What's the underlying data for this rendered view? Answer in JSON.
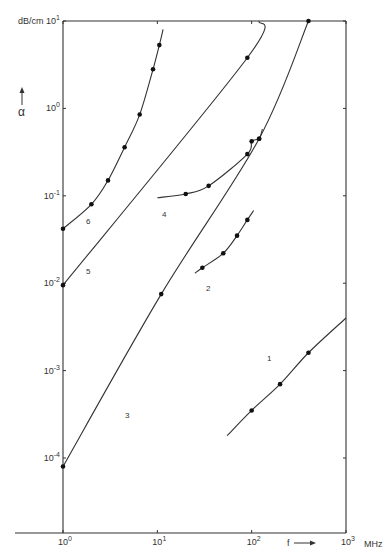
{
  "chart_data": {
    "type": "line",
    "title": "",
    "xlabel": "f",
    "xunit": "MHz",
    "ylabel": "α",
    "yunit": "dB/cm",
    "xscale": "log",
    "yscale": "log",
    "xlim": [
      1,
      1000
    ],
    "ylim": [
      0.0001,
      10
    ],
    "x_ticks": [
      "10^0",
      "10^1",
      "10^2",
      "10^3"
    ],
    "y_ticks": [
      "10^1",
      "10^0",
      "10^-1",
      "10^-2",
      "10^-3",
      "10^-4"
    ],
    "grid": false,
    "legend": "inline curve numbers",
    "series": [
      {
        "name": "1",
        "points": [
          [
            100,
            0.00035
          ],
          [
            200,
            0.0007
          ],
          [
            400,
            0.0016
          ]
        ],
        "line_from": [
          55,
          0.00018
        ],
        "line_to": [
          1000,
          0.004
        ]
      },
      {
        "name": "2",
        "points": [
          [
            30,
            0.015
          ],
          [
            50,
            0.022
          ],
          [
            70,
            0.035
          ],
          [
            90,
            0.053
          ]
        ],
        "line_from": [
          25,
          0.013
        ],
        "line_to": [
          105,
          0.068
        ]
      },
      {
        "name": "3",
        "points": [
          [
            1,
            8e-05
          ],
          [
            11,
            0.0075
          ],
          [
            120,
            0.45
          ],
          [
            400,
            10
          ]
        ],
        "line_from": [
          1,
          8e-05
        ],
        "line_to": [
          400,
          10
        ]
      },
      {
        "name": "4",
        "points": [
          [
            20,
            0.105
          ],
          [
            35,
            0.13
          ],
          [
            90,
            0.3
          ],
          [
            100,
            0.42
          ],
          [
            120,
            0.45
          ]
        ],
        "line_from": [
          10,
          0.095
        ],
        "line_to": [
          130,
          0.58
        ]
      },
      {
        "name": "5",
        "points": [
          [
            1,
            0.0095
          ],
          [
            90,
            3.8
          ]
        ],
        "line_from": [
          1,
          0.0095
        ],
        "line_to": [
          120,
          10
        ]
      },
      {
        "name": "6",
        "points": [
          [
            1,
            0.042
          ],
          [
            2,
            0.08
          ],
          [
            3,
            0.15
          ],
          [
            4.5,
            0.36
          ],
          [
            6.5,
            0.85
          ],
          [
            9,
            2.8
          ],
          [
            10.5,
            5.3
          ]
        ],
        "line_from": [
          1,
          0.042
        ],
        "line_to": [
          11.5,
          8.0
        ]
      }
    ]
  },
  "axes": {
    "y_unit_label": "dB/cm",
    "y_symbol": "α",
    "x_symbol": "f",
    "x_unit_label": "MHz",
    "y_tick_labels": [
      {
        "base": "10",
        "exp": "1"
      },
      {
        "base": "10",
        "exp": "0"
      },
      {
        "base": "10",
        "exp": "-1"
      },
      {
        "base": "10",
        "exp": "-2"
      },
      {
        "base": "10",
        "exp": "-3"
      },
      {
        "base": "10",
        "exp": "-4"
      }
    ],
    "x_tick_labels": [
      {
        "base": "10",
        "exp": "0"
      },
      {
        "base": "10",
        "exp": "1"
      },
      {
        "base": "10",
        "exp": "2"
      },
      {
        "base": "10",
        "exp": "3"
      }
    ]
  },
  "curve_labels": [
    "1",
    "2",
    "3",
    "4",
    "5",
    "6"
  ],
  "colors": {
    "ink": "#333333",
    "background": "#ffffff"
  }
}
